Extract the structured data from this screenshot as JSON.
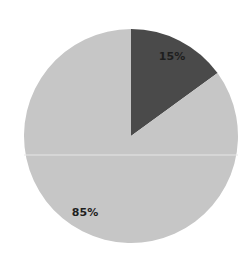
{
  "chart_data": {
    "type": "pie",
    "title": "",
    "categories": [
      "Segment A",
      "Segment B"
    ],
    "values": [
      15,
      85
    ],
    "labels": [
      "15%",
      "85%"
    ],
    "colors": [
      "#4a4a4a",
      "#c6c6c6"
    ],
    "start_angle_deg": 0,
    "direction": "clockwise",
    "legend": "none",
    "grid": false
  },
  "geometry": {
    "cx": 131,
    "cy": 136,
    "r": 107
  }
}
